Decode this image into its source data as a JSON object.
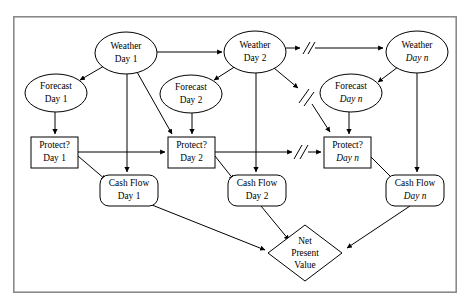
{
  "figure": {
    "frame": {
      "x": 13,
      "y": 16,
      "width": 444,
      "height": 277,
      "color": "#8a8a8a"
    },
    "background": "#ffffff",
    "line_color": "#000000"
  },
  "nodes": [
    {
      "id": "weather-day-1",
      "type": "ellipse",
      "line1": "Weather",
      "line2": "Day 1",
      "cx": 126,
      "cy": 53,
      "rx": 31,
      "ry": 21
    },
    {
      "id": "weather-day-2",
      "type": "ellipse",
      "line1": "Weather",
      "line2": "Day 2",
      "cx": 255,
      "cy": 52,
      "rx": 31,
      "ry": 21
    },
    {
      "id": "weather-day-n",
      "type": "ellipse",
      "line1": "Weather",
      "line2": "Day n",
      "cx": 417,
      "cy": 52,
      "rx": 31,
      "ry": 21
    },
    {
      "id": "forecast-day-1",
      "type": "ellipse",
      "line1": "Forecast",
      "line2": "Day 1",
      "cx": 56,
      "cy": 93,
      "rx": 31,
      "ry": 19
    },
    {
      "id": "forecast-day-2",
      "type": "ellipse",
      "line1": "Forecast",
      "line2": "Day 2",
      "cx": 191,
      "cy": 94,
      "rx": 31,
      "ry": 19
    },
    {
      "id": "forecast-day-n",
      "type": "ellipse",
      "line1": "Forecast",
      "line2": "Day n",
      "cx": 351,
      "cy": 93,
      "rx": 31,
      "ry": 19
    },
    {
      "id": "protect-day-1",
      "type": "rect",
      "line1": "Protect?",
      "line2": "Day 1",
      "x": 31,
      "y": 137,
      "width": 47,
      "height": 31
    },
    {
      "id": "protect-day-2",
      "type": "rect",
      "line1": "Protect?",
      "line2": "Day 2",
      "x": 168,
      "y": 137,
      "width": 47,
      "height": 31
    },
    {
      "id": "protect-day-n",
      "type": "rect",
      "line1": "Protect?",
      "line2": "Day n",
      "x": 324,
      "y": 137,
      "width": 47,
      "height": 31
    },
    {
      "id": "cash-flow-day-1",
      "type": "roundrect",
      "line1": "Cash Flow",
      "line2": "Day 1",
      "x": 100,
      "y": 175,
      "width": 58,
      "height": 31
    },
    {
      "id": "cash-flow-day-2",
      "type": "roundrect",
      "line1": "Cash Flow",
      "line2": "Day 2",
      "x": 228,
      "y": 175,
      "width": 58,
      "height": 31
    },
    {
      "id": "cash-flow-day-n",
      "type": "roundrect",
      "line1": "Cash Flow",
      "line2": "Day n",
      "x": 386,
      "y": 175,
      "width": 58,
      "height": 31
    },
    {
      "id": "net-present-value",
      "type": "diamond",
      "line1": "Net",
      "line2": "Present",
      "line3": "Value",
      "cx": 305,
      "cy": 253,
      "rx": 37,
      "ry": 28
    }
  ],
  "edges": [
    {
      "id": "weather1-to-forecast1",
      "from": "weather-day-1",
      "to": "forecast-day-1",
      "break": false
    },
    {
      "id": "weather1-to-weather2",
      "from": "weather-day-1",
      "to": "weather-day-2",
      "break": false
    },
    {
      "id": "weather1-to-protect2",
      "from": "weather-day-1",
      "to": "protect-day-2",
      "break": false
    },
    {
      "id": "weather1-to-cashflow1",
      "from": "weather-day-1",
      "to": "cash-flow-day-1",
      "break": false
    },
    {
      "id": "forecast1-to-protect1",
      "from": "forecast-day-1",
      "to": "protect-day-1",
      "break": false
    },
    {
      "id": "protect1-to-protect2",
      "from": "protect-day-1",
      "to": "protect-day-2",
      "break": false
    },
    {
      "id": "protect1-to-cashflow1",
      "from": "protect-day-1",
      "to": "cash-flow-day-1",
      "break": false
    },
    {
      "id": "weather2-to-forecast2",
      "from": "weather-day-2",
      "to": "forecast-day-2",
      "break": false
    },
    {
      "id": "weather2-to-weathern",
      "from": "weather-day-2",
      "to": "weather-day-n",
      "break": true
    },
    {
      "id": "weather2-to-protectn",
      "from": "weather-day-2",
      "to": "protect-day-n",
      "break": true
    },
    {
      "id": "weather2-to-cashflow2",
      "from": "weather-day-2",
      "to": "cash-flow-day-2",
      "break": false
    },
    {
      "id": "forecast2-to-protect2",
      "from": "forecast-day-2",
      "to": "protect-day-2",
      "break": false
    },
    {
      "id": "protect2-to-protectn",
      "from": "protect-day-2",
      "to": "protect-day-n",
      "break": true
    },
    {
      "id": "protect2-to-cashflow2",
      "from": "protect-day-2",
      "to": "cash-flow-day-2",
      "break": false
    },
    {
      "id": "weathern-to-forecastn",
      "from": "weather-day-n",
      "to": "forecast-day-n",
      "break": false
    },
    {
      "id": "weathern-to-cashflown",
      "from": "weather-day-n",
      "to": "cash-flow-day-n",
      "break": false
    },
    {
      "id": "forecastn-to-protectn",
      "from": "forecast-day-n",
      "to": "protect-day-n",
      "break": false
    },
    {
      "id": "protectn-to-cashflown",
      "from": "protect-day-n",
      "to": "cash-flow-day-n",
      "break": false
    },
    {
      "id": "cashflow1-to-npv",
      "from": "cash-flow-day-1",
      "to": "net-present-value",
      "break": false
    },
    {
      "id": "cashflow2-to-npv",
      "from": "cash-flow-day-2",
      "to": "net-present-value",
      "break": false
    },
    {
      "id": "cashflown-to-npv",
      "from": "cash-flow-day-n",
      "to": "net-present-value",
      "break": false
    }
  ],
  "break_marks": [
    {
      "id": "break-weather-row",
      "x": 307,
      "y": 48
    },
    {
      "id": "break-weather-diag",
      "x": 308,
      "y": 97
    },
    {
      "id": "break-protect-row",
      "x": 301,
      "y": 152
    }
  ]
}
